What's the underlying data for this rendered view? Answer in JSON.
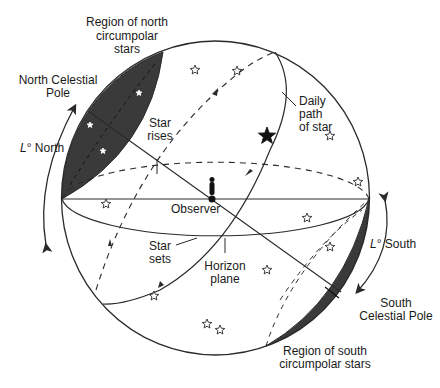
{
  "diagram": {
    "colors": {
      "line": "#2a2a2a",
      "fill_dark": "#3a3a3a",
      "background": "#ffffff"
    },
    "labels": {
      "north_region": [
        "Region of north",
        "circumpolar",
        "stars"
      ],
      "north_pole": [
        "North Celestial",
        "Pole"
      ],
      "lat_north_prefix": "L",
      "lat_north_suffix": "° North",
      "star_rises": [
        "Star",
        "rises"
      ],
      "daily_path": [
        "Daily",
        "path",
        "of star"
      ],
      "observer": "Observer",
      "star_sets": [
        "Star",
        "sets"
      ],
      "horizon_plane": [
        "Horizon",
        "plane"
      ],
      "lat_south_prefix": "L",
      "lat_south_suffix": "° South",
      "south_pole": [
        "South",
        "Celestial Pole"
      ],
      "south_region": [
        "Region of south",
        "circumpolar stars"
      ]
    },
    "stars": [
      {
        "x": 195,
        "y": 70
      },
      {
        "x": 237,
        "y": 71
      },
      {
        "x": 330,
        "y": 136
      },
      {
        "x": 358,
        "y": 182
      },
      {
        "x": 106,
        "y": 204
      },
      {
        "x": 307,
        "y": 218
      },
      {
        "x": 330,
        "y": 247
      },
      {
        "x": 267,
        "y": 270
      },
      {
        "x": 154,
        "y": 296
      },
      {
        "x": 207,
        "y": 324
      },
      {
        "x": 220,
        "y": 330
      }
    ],
    "white_stars_in_north_region": [
      {
        "x": 139,
        "y": 93
      },
      {
        "x": 90,
        "y": 125
      },
      {
        "x": 103,
        "y": 151
      }
    ],
    "featured_star": {
      "x": 267,
      "y": 136
    }
  }
}
